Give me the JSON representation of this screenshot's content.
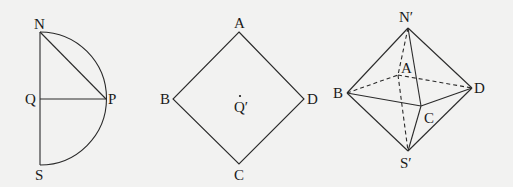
{
  "figures": [
    {
      "id": "semicircle",
      "labels": {
        "N": "N",
        "P": "P",
        "Q": "Q",
        "S": "S"
      },
      "points": {
        "N": [
          40,
          32
        ],
        "Q": [
          40,
          99
        ],
        "P": [
          106,
          99
        ],
        "S": [
          40,
          165
        ]
      }
    },
    {
      "id": "square",
      "labels": {
        "A": "A",
        "B": "B",
        "C": "C",
        "D": "D",
        "Q": "Q′"
      },
      "points": {
        "A": [
          239,
          32
        ],
        "B": [
          173,
          99
        ],
        "C": [
          239,
          164
        ],
        "D": [
          304,
          99
        ],
        "Q": [
          240,
          103
        ]
      }
    },
    {
      "id": "octahedron",
      "labels": {
        "N": "N′",
        "A": "A",
        "B": "B",
        "C": "C",
        "D": "D",
        "S": "S′"
      },
      "points": {
        "N": [
          408,
          28
        ],
        "A": [
          398,
          75
        ],
        "B": [
          347,
          93
        ],
        "C": [
          421,
          106
        ],
        "D": [
          472,
          88
        ],
        "S": [
          408,
          151
        ]
      }
    }
  ]
}
